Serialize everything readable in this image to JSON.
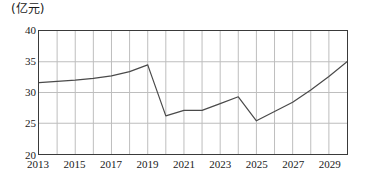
{
  "chart_data": {
    "type": "line",
    "title": "",
    "subtitle": "",
    "unit_label": "(亿元)",
    "xlabel": "",
    "ylabel": "",
    "xlim": [
      2013,
      2030
    ],
    "ylim": [
      20,
      40
    ],
    "yticks": [
      20,
      25,
      30,
      35,
      40
    ],
    "ytick_labels": [
      "20",
      "25",
      "30",
      "35",
      "40"
    ],
    "xticks": [
      2013,
      2015,
      2017,
      2019,
      2021,
      2023,
      2025,
      2027,
      2029
    ],
    "xtick_labels": [
      "2013",
      "2015",
      "2017",
      "2019",
      "2021",
      "2023",
      "2025",
      "2027",
      "2029"
    ],
    "x_gridline_years": [
      2013,
      2014,
      2015,
      2016,
      2017,
      2018,
      2019,
      2020,
      2021,
      2022,
      2023,
      2024,
      2025,
      2026,
      2027,
      2028,
      2029,
      2030
    ],
    "grid": true,
    "legend": false,
    "legend_position": "none",
    "line_color": "#4a4a4a",
    "grid_color": "#bdbdbd",
    "frame_color": "#3a3a3a",
    "background_color": "#ffffff",
    "x": [
      2013,
      2014,
      2015,
      2016,
      2017,
      2018,
      2019,
      2020,
      2021,
      2022,
      2023,
      2024,
      2025,
      2026,
      2027,
      2028,
      2029,
      2030
    ],
    "values": [
      31.6,
      31.8,
      32.0,
      32.3,
      32.7,
      33.4,
      34.5,
      26.2,
      27.1,
      27.1,
      28.2,
      29.3,
      25.4,
      26.9,
      28.4,
      30.4,
      32.6,
      35.0
    ],
    "series": [
      {
        "name": "",
        "values": [
          31.6,
          31.8,
          32.0,
          32.3,
          32.7,
          33.4,
          34.5,
          26.2,
          27.1,
          27.1,
          28.2,
          29.3,
          25.4,
          26.9,
          28.4,
          30.4,
          32.6,
          35.0
        ]
      }
    ],
    "annotations": []
  }
}
